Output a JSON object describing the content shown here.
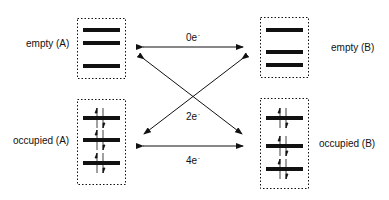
{
  "diagram": {
    "type": "electron-transfer-orbital-diagram",
    "colors": {
      "ink": "#111111",
      "background": "#ffffff"
    },
    "labels": {
      "empty_a": "empty  (A)",
      "empty_b": "empty  (B)",
      "occupied_a": "occupied  (A)",
      "occupied_b": "occupied  (B)"
    },
    "transfers": {
      "top": {
        "value": "0e",
        "sup": "-",
        "from": "empty (A)",
        "to": "empty (B)"
      },
      "cross": {
        "value": "2e",
        "sup": "-",
        "connects": [
          "empty (A) ↔ occupied (B)",
          "occupied (A) ↔ empty (B)"
        ]
      },
      "bottom": {
        "value": "4e",
        "sup": "-",
        "from": "occupied (A)",
        "to": "occupied (B)"
      }
    },
    "boxes": [
      {
        "id": "empty-a",
        "levels": 3,
        "occupied": false
      },
      {
        "id": "occupied-a",
        "levels": 3,
        "occupied": true,
        "spin_pairs": 3
      },
      {
        "id": "empty-b",
        "levels": 3,
        "occupied": false
      },
      {
        "id": "occupied-b",
        "levels": 3,
        "occupied": true,
        "spin_pairs": 3
      }
    ]
  }
}
